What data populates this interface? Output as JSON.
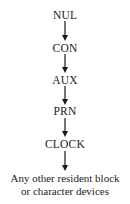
{
  "diagram": {
    "type": "flow-chain",
    "direction": "top-to-bottom",
    "nodes": [
      {
        "label": "NUL"
      },
      {
        "label": "CON"
      },
      {
        "label": "AUX"
      },
      {
        "label": "PRN"
      },
      {
        "label": "CLOCK"
      }
    ],
    "terminal": {
      "line1": "Any other resident block",
      "line2": "or character devices"
    },
    "edges": [
      {
        "from": "NUL",
        "to": "CON"
      },
      {
        "from": "CON",
        "to": "AUX"
      },
      {
        "from": "AUX",
        "to": "PRN"
      },
      {
        "from": "PRN",
        "to": "CLOCK"
      },
      {
        "from": "CLOCK",
        "to": "Any other resident block or character devices"
      }
    ],
    "colors": {
      "text": "#1a1a1a",
      "background": "#ffffff"
    }
  }
}
